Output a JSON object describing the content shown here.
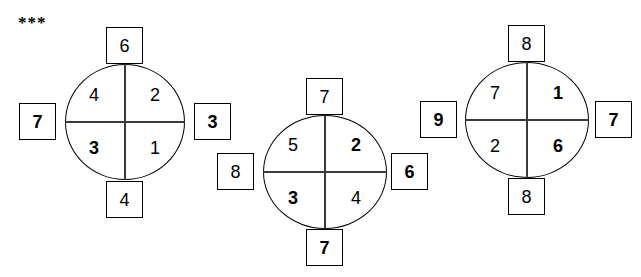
{
  "marker": {
    "text": "***"
  },
  "canvas": {
    "width": 641,
    "height": 277,
    "background": "#ffffff",
    "ink": "#000000"
  },
  "puzzles": [
    {
      "id": "puzzle-1",
      "center": {
        "x": 125,
        "y": 122
      },
      "radius": {
        "rx": 60,
        "ry": 58
      },
      "inner": {
        "top_left": {
          "value": "4",
          "bold": false
        },
        "top_right": {
          "value": "2",
          "bold": false
        },
        "bottom_left": {
          "value": "3",
          "bold": true
        },
        "bottom_right": {
          "value": "1",
          "bold": false
        }
      },
      "outer": {
        "top": {
          "value": "6",
          "bold": false
        },
        "right": {
          "value": "3",
          "bold": true
        },
        "bottom": {
          "value": "4",
          "bold": false
        },
        "left": {
          "value": "7",
          "bold": true
        }
      }
    },
    {
      "id": "puzzle-2",
      "center": {
        "x": 325,
        "y": 172
      },
      "radius": {
        "rx": 62,
        "ry": 57
      },
      "inner": {
        "top_left": {
          "value": "5",
          "bold": false
        },
        "top_right": {
          "value": "2",
          "bold": true
        },
        "bottom_left": {
          "value": "3",
          "bold": true
        },
        "bottom_right": {
          "value": "4",
          "bold": false
        }
      },
      "outer": {
        "top": {
          "value": "7",
          "bold": false
        },
        "right": {
          "value": "6",
          "bold": true
        },
        "bottom": {
          "value": "7",
          "bold": true
        },
        "left": {
          "value": "8",
          "bold": false
        }
      }
    },
    {
      "id": "puzzle-3",
      "center": {
        "x": 527,
        "y": 120
      },
      "radius": {
        "rx": 62,
        "ry": 58
      },
      "inner": {
        "top_left": {
          "value": "7",
          "bold": false
        },
        "top_right": {
          "value": "1",
          "bold": true
        },
        "bottom_left": {
          "value": "2",
          "bold": false
        },
        "bottom_right": {
          "value": "6",
          "bold": true
        }
      },
      "outer": {
        "top": {
          "value": "8",
          "bold": false
        },
        "right": {
          "value": "7",
          "bold": true
        },
        "bottom": {
          "value": "8",
          "bold": false
        },
        "left": {
          "value": "9",
          "bold": true
        }
      }
    }
  ]
}
